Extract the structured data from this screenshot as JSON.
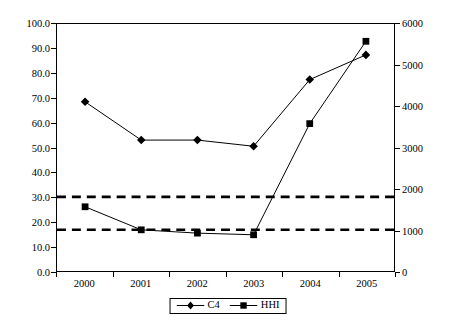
{
  "chart_data": {
    "type": "line",
    "title": "",
    "subtitle": "",
    "xlabel": "",
    "ylabel": "",
    "categories": [
      "2000",
      "2001",
      "2002",
      "2003",
      "2004",
      "2005"
    ],
    "x": [
      2000,
      2001,
      2002,
      2003,
      2004,
      2005
    ],
    "grid": false,
    "legend_position": "bottom-center",
    "axes": {
      "left": {
        "label": "",
        "min": 0.0,
        "max": 100.0,
        "step": 10.0,
        "ticks": [
          "0.0",
          "10.0",
          "20.0",
          "30.0",
          "40.0",
          "50.0",
          "60.0",
          "70.0",
          "80.0",
          "90.0",
          "100.0"
        ],
        "tick_values": [
          0,
          10,
          20,
          30,
          40,
          50,
          60,
          70,
          80,
          90,
          100
        ]
      },
      "right": {
        "label": "",
        "min": 0,
        "max": 6000,
        "step": 1000,
        "ticks": [
          "0",
          "1000",
          "2000",
          "3000",
          "4000",
          "5000",
          "6000"
        ],
        "tick_values": [
          0,
          1000,
          2000,
          3000,
          4000,
          5000,
          6000
        ]
      },
      "bottom": {
        "label": "",
        "ticks": [
          "2000",
          "2001",
          "2002",
          "2003",
          "2004",
          "2005"
        ]
      }
    },
    "series": [
      {
        "name": "C4",
        "axis": "left",
        "marker": "diamond",
        "color": "#000000",
        "linestyle": "solid",
        "values": [
          68.5,
          53.0,
          53.0,
          50.5,
          77.5,
          87.5
        ]
      },
      {
        "name": "HHI",
        "axis": "right",
        "marker": "square",
        "color": "#000000",
        "linestyle": "solid",
        "values": [
          1560,
          1000,
          920,
          880,
          3580,
          5580
        ]
      }
    ],
    "reference_lines": [
      {
        "name": "hhi-upper-threshold",
        "axis": "right",
        "value": 1800,
        "linestyle": "dashed",
        "color": "#000000"
      },
      {
        "name": "hhi-lower-threshold",
        "axis": "right",
        "value": 1000,
        "linestyle": "dashed",
        "color": "#000000"
      }
    ]
  },
  "legend": {
    "entries": [
      {
        "label": "C4",
        "marker": "diamond"
      },
      {
        "label": "HHI",
        "marker": "square"
      }
    ]
  },
  "colors": {
    "line": "#000000",
    "axis": "#000000",
    "background": "#ffffff"
  }
}
